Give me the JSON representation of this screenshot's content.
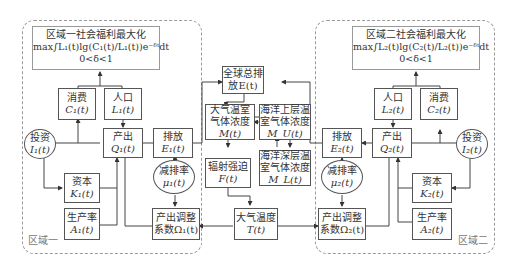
{
  "region1": {
    "label": "区域一",
    "objective": {
      "title": "区域一社会福利最大化",
      "formula": "max∫L₁(t)lg(C₁(t)/L₁(t))e⁻ᵟᵗdt",
      "constraint": "0<δ<1"
    },
    "consumption": {
      "label": "消费",
      "var": "C₁(t)"
    },
    "population": {
      "label": "人口",
      "var": "L₁(t)"
    },
    "investment": {
      "label": "投资",
      "var": "I₁(t)"
    },
    "output": {
      "label": "产出",
      "var": "Q₁(t)"
    },
    "emission": {
      "label": "排放",
      "var": "E₁(t)"
    },
    "capital": {
      "label": "资本",
      "var": "K₁(t)"
    },
    "abatement": {
      "label": "减排率",
      "var": "μ₁(t)"
    },
    "productivity": {
      "label": "生产率",
      "var": "A₁(t)"
    },
    "adjustment": {
      "label1": "产出调整",
      "label2": "系数Ω₁(t)"
    }
  },
  "region2": {
    "label": "区域二",
    "objective": {
      "title": "区域二社会福利最大化",
      "formula": "max∫L₂(t)lg(C₂(t)/L₂(t))e⁻ᵟᵗdt",
      "constraint": "0<δ<1"
    },
    "consumption": {
      "label": "消费",
      "var": "C₂(t)"
    },
    "population": {
      "label": "人口",
      "var": "L₂(t)"
    },
    "investment": {
      "label": "投资",
      "var": "I₂(t)"
    },
    "output": {
      "label": "产出",
      "var": "Q₂(t)"
    },
    "emission": {
      "label": "排放",
      "var": "E₂(t)"
    },
    "capital": {
      "label": "资本",
      "var": "K₂(t)"
    },
    "abatement": {
      "label": "减排率",
      "var": "μ₂(t)"
    },
    "productivity": {
      "label": "生产率",
      "var": "A₂(t)"
    },
    "adjustment": {
      "label1": "产出调整",
      "label2": "系数Ω₂(t)"
    }
  },
  "global": {
    "total_emission": {
      "label1": "全球总排",
      "label2": "放E(t)"
    },
    "atmos_ghg": {
      "label1": "大气温室",
      "label2": "气体浓度",
      "var": "M(t)"
    },
    "upper_ocean_ghg": {
      "label1": "海洋上层温",
      "label2": "室气体浓度",
      "var": "M_U(t)"
    },
    "radiative_forcing": {
      "label": "辐射强迫",
      "var": "F(t)"
    },
    "deep_ocean_ghg": {
      "label1": "海洋深层温",
      "label2": "室气体浓度",
      "var": "M_L(t)"
    },
    "atmos_temp": {
      "label": "大气温度",
      "var": "T(t)"
    }
  }
}
